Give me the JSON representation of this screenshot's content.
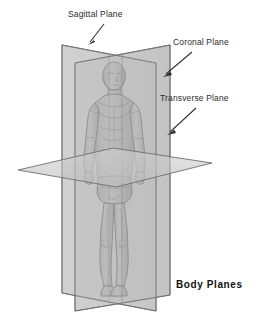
{
  "diagram": {
    "title": "Body Planes",
    "background_color": "#ffffff",
    "labels": [
      {
        "id": "sagittal",
        "text": "Sagittal Plane",
        "text_x": 68,
        "text_y": 17,
        "arrow_from_x": 104,
        "arrow_from_y": 24,
        "arrow_to_x": 88,
        "arrow_to_y": 45
      },
      {
        "id": "coronal",
        "text": "Coronal Plane",
        "text_x": 173,
        "text_y": 45,
        "arrow_from_x": 192,
        "arrow_from_y": 52,
        "arrow_to_x": 164,
        "arrow_to_y": 77
      },
      {
        "id": "transverse",
        "text": "Transverse Plane",
        "text_x": 163,
        "text_y": 101,
        "arrow_from_x": 196,
        "arrow_from_y": 108,
        "arrow_to_x": 168,
        "arrow_to_y": 135
      }
    ],
    "planes": [
      {
        "id": "sagittal-plane",
        "name": "Sagittal Plane",
        "orientation": "vertical, divides body into left and right",
        "fill": "#b9b9b9",
        "stroke": "#6e6e6e",
        "opacity": 0.78
      },
      {
        "id": "coronal-plane",
        "name": "Coronal Plane",
        "orientation": "vertical, divides body into front and back",
        "fill": "#c4c4c4",
        "stroke": "#6e6e6e",
        "opacity": 0.72
      },
      {
        "id": "transverse-plane",
        "name": "Transverse Plane",
        "orientation": "horizontal, divides body into upper and lower",
        "fill": "#c9c9c9",
        "stroke": "#6e6e6e",
        "opacity": 0.8
      }
    ],
    "body": {
      "fill": "#a8a8a8",
      "shade": "#909090",
      "outline": "#4a4a4a"
    },
    "title_x": 176,
    "title_y": 288
  }
}
